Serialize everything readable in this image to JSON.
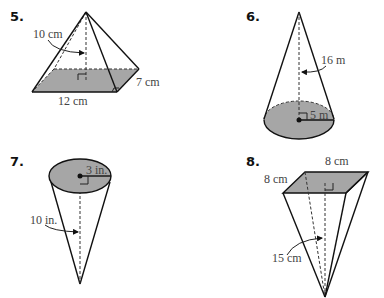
{
  "problems": [
    {
      "number": "5.",
      "shape": "square pyramid (rectangular base)",
      "labels": {
        "height": "10 cm",
        "base_width": "7 cm",
        "base_length": "12 cm"
      }
    },
    {
      "number": "6.",
      "shape": "cone",
      "labels": {
        "height": "16 m",
        "radius": "5 m"
      }
    },
    {
      "number": "7.",
      "shape": "inverted cone",
      "labels": {
        "radius": "3 in.",
        "height": "10 in."
      }
    },
    {
      "number": "8.",
      "shape": "inverted square pyramid",
      "labels": {
        "top_edge": "8 cm",
        "side_edge": "8 cm",
        "height": "15 cm"
      }
    }
  ],
  "colors": {
    "shade": "#a6a6a6",
    "line": "#111111",
    "label": "#444444"
  }
}
